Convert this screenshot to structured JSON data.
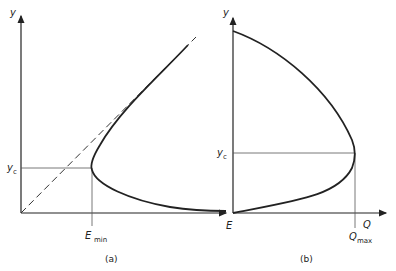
{
  "figure": {
    "panel_a": {
      "caption": "(a)",
      "y_axis_label": "y",
      "x_axis_label": "E",
      "yc_label": "y",
      "yc_sub": "c",
      "emin_label": "E",
      "emin_sub": "min",
      "curve": "specific energy curve E vs depth y",
      "asymptote": "dashed line E = y"
    },
    "panel_b": {
      "caption": "(b)",
      "y_axis_label": "y",
      "x_axis_label": "Q",
      "yc_label": "y",
      "yc_sub": "c",
      "qmax_label": "Q",
      "qmax_sub": "max",
      "curve": "discharge curve Q vs depth y"
    },
    "colors": {
      "line": "#222222",
      "guide": "#555555",
      "background": "#ffffff"
    }
  }
}
